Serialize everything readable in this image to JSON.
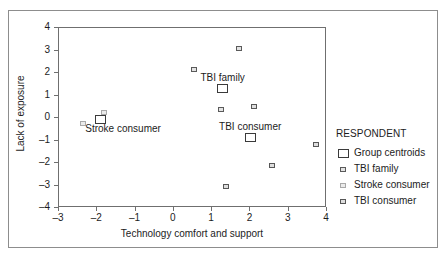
{
  "chart_data": {
    "type": "scatter",
    "title": "",
    "xlabel": "Technology comfort and support",
    "ylabel": "Lack of exposure",
    "xlim": [
      -3,
      4
    ],
    "ylim": [
      -4,
      4
    ],
    "xticks": [
      "-3",
      "-2",
      "-1",
      "0",
      "1",
      "2",
      "3",
      "4"
    ],
    "yticks": [
      "4",
      "3",
      "2",
      "1",
      "0",
      "-1",
      "-2",
      "-3",
      "-4"
    ],
    "grid": false,
    "legend_position": "right",
    "legend_title": "RESPONDENT",
    "series": [
      {
        "name": "Group centroids",
        "marker": "large-open-square",
        "points": [
          {
            "x": -1.88,
            "y": -0.12,
            "label": "Stroke consumer"
          },
          {
            "x": 1.3,
            "y": 1.25,
            "label": "TBI family"
          },
          {
            "x": 2.02,
            "y": -0.9,
            "label": "TBI consumer"
          }
        ]
      },
      {
        "name": "TBI family",
        "marker": "small-square-dark",
        "points": [
          {
            "x": 0.55,
            "y": 2.1
          },
          {
            "x": 1.72,
            "y": 3.05
          },
          {
            "x": 1.25,
            "y": 0.32
          }
        ]
      },
      {
        "name": "Stroke consumer",
        "marker": "small-square-light",
        "points": [
          {
            "x": -2.35,
            "y": -0.28
          },
          {
            "x": -1.8,
            "y": 0.2
          }
        ]
      },
      {
        "name": "TBI consumer",
        "marker": "small-square-medium",
        "points": [
          {
            "x": 2.12,
            "y": 0.45
          },
          {
            "x": 3.75,
            "y": -1.2
          },
          {
            "x": 2.58,
            "y": -2.15
          },
          {
            "x": 1.4,
            "y": -3.08
          }
        ]
      }
    ],
    "annotations": [
      {
        "text": "TBI family",
        "x": 1.3,
        "y": 1.72
      },
      {
        "text": "Stroke consumer",
        "x": -1.3,
        "y": -0.52
      },
      {
        "text": "TBI consumer",
        "x": 2.02,
        "y": -0.46
      }
    ]
  },
  "legend": {
    "title": "RESPONDENT",
    "items": [
      {
        "label": "Group centroids",
        "marker": "large-open-square"
      },
      {
        "label": "TBI family",
        "marker": "small-square-dark"
      },
      {
        "label": "Stroke consumer",
        "marker": "small-square-light"
      },
      {
        "label": "TBI consumer",
        "marker": "small-square-medium"
      }
    ]
  },
  "axes": {
    "x_label": "Technology comfort and support",
    "y_label": "Lack of exposure",
    "x_tick_labels": [
      "-3",
      "-2",
      "-1",
      "0",
      "1",
      "2",
      "3",
      "4"
    ],
    "y_tick_labels": [
      "4",
      "3",
      "2",
      "1",
      "0",
      "-1",
      "-2",
      "-3",
      "-4"
    ]
  },
  "colors": {
    "frame": "#8d8d8d",
    "axis": "#6f6f6f",
    "text": "#1c1c1c",
    "centroid_stroke": "#3a3a3a",
    "family_fill": "#e3e3e3",
    "stroke_fill": "#ebebeb",
    "consumer_fill": "#dedede",
    "background": "#ffffff"
  }
}
